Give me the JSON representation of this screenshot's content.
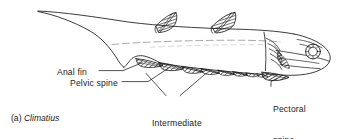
{
  "figure": {
    "caption_prefix": "(a)",
    "caption_taxon": "Climatius",
    "background_color": "#ffffff",
    "ink_color": "#1a1a1a"
  },
  "labels": {
    "anal_fin": "Anal fin",
    "pelvic_spine": "Pelvic spine",
    "intermediate_spines_line1": "Intermediate",
    "intermediate_spines_line2": "spines",
    "pectoral_spine_line1": "Pectoral",
    "pectoral_spine_line2": "spine"
  },
  "anatomy": {
    "body_outline": "fusiform shark-like body with heterocercal upturned tail at left and blunt head at right",
    "lateral_line": "faint dashed line running along mid-body",
    "dorsal_fins": 2,
    "intermediate_spine_count": 6,
    "eye": "large circular orbit with sclerotic ring near head front",
    "gill_structures": "series of curved branchial arch bars behind the jaw"
  }
}
